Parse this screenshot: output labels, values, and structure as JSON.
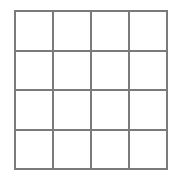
{
  "figure": {
    "name": "blank-grid",
    "title": "",
    "caption": "",
    "background_color": "#ffffff"
  },
  "grid": {
    "rows": 4,
    "columns": 4,
    "cell_count": 16,
    "line_color": "#7a7a7a",
    "line_width_px": 2,
    "cell_fill_color": "#ffffff",
    "bounds": {
      "left_px": 14,
      "top_px": 10,
      "width_px": 154,
      "height_px": 160
    },
    "cell_width_px": 38.5,
    "cell_height_px": 40,
    "vertical_line_x": [
      14,
      52.5,
      91,
      129.5,
      168
    ],
    "horizontal_line_y": [
      10,
      50,
      90,
      130,
      170
    ],
    "cells": [
      {
        "row": 1,
        "column": 1,
        "label": ""
      },
      {
        "row": 1,
        "column": 2,
        "label": ""
      },
      {
        "row": 1,
        "column": 3,
        "label": ""
      },
      {
        "row": 1,
        "column": 4,
        "label": ""
      },
      {
        "row": 2,
        "column": 1,
        "label": ""
      },
      {
        "row": 2,
        "column": 2,
        "label": ""
      },
      {
        "row": 2,
        "column": 3,
        "label": ""
      },
      {
        "row": 2,
        "column": 4,
        "label": ""
      },
      {
        "row": 3,
        "column": 1,
        "label": ""
      },
      {
        "row": 3,
        "column": 2,
        "label": ""
      },
      {
        "row": 3,
        "column": 3,
        "label": ""
      },
      {
        "row": 3,
        "column": 4,
        "label": ""
      },
      {
        "row": 4,
        "column": 1,
        "label": ""
      },
      {
        "row": 4,
        "column": 2,
        "label": ""
      },
      {
        "row": 4,
        "column": 3,
        "label": ""
      },
      {
        "row": 4,
        "column": 4,
        "label": ""
      }
    ]
  }
}
